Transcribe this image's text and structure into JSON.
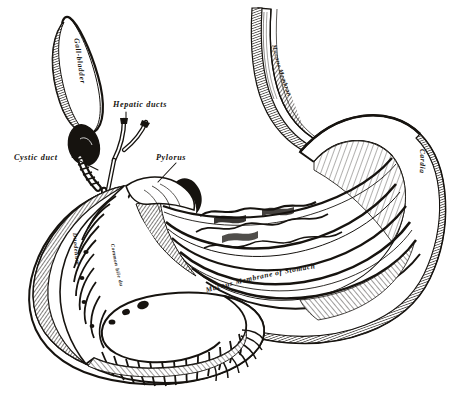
{
  "figure": {
    "background_color": "#ffffff",
    "ink_color": "#16130f",
    "width": 464,
    "height": 409,
    "style": "monochrome steel engraving / line hatching"
  },
  "labels": {
    "gall_bladder": "Gall-bladder",
    "hepatic_ducts": "Hepatic ducts",
    "cystic_duct": "Cystic duct",
    "pylorus": "Pylorus",
    "cardia": "Cardia",
    "esophagus_mucous_membrane": "Mucous Membrane",
    "duodenum": "Duodenum",
    "common_bile_duct": "Common bile duct",
    "stomach_mucous_membrane": "Mucous Membrane of Stomach"
  },
  "structures": [
    {
      "name": "gall-bladder",
      "label": "Gall-bladder"
    },
    {
      "name": "hepatic-ducts",
      "label": "Hepatic ducts"
    },
    {
      "name": "cystic-duct",
      "label": "Cystic duct"
    },
    {
      "name": "common-bile-duct",
      "label": "Common bile duct"
    },
    {
      "name": "pylorus",
      "label": "Pylorus"
    },
    {
      "name": "cardia",
      "label": "Cardia"
    },
    {
      "name": "oesophagus",
      "label": "Mucous Membrane"
    },
    {
      "name": "duodenum",
      "label": "Duodenum"
    },
    {
      "name": "stomach-interior",
      "label": "Mucous Membrane of Stomach"
    }
  ]
}
